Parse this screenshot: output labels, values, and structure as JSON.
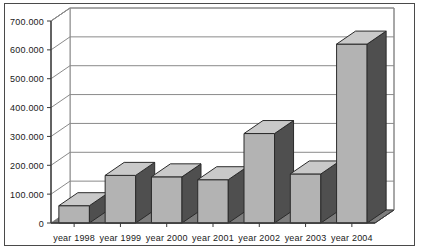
{
  "chart_data": {
    "type": "bar",
    "title": "",
    "subtitle": "",
    "xlabel": "",
    "ylabel": "",
    "categories": [
      "year 1998",
      "year 1999",
      "year 2000",
      "year 2001",
      "year 2002",
      "year 2003",
      "year 2004"
    ],
    "values": [
      60000,
      165000,
      160000,
      150000,
      310000,
      170000,
      620000
    ],
    "ylim": [
      0,
      700000
    ],
    "ytick_values": [
      0,
      100000,
      200000,
      300000,
      400000,
      500000,
      600000,
      700000
    ],
    "ytick_labels": [
      "0",
      "100.000",
      "200.000",
      "300.000",
      "400.000",
      "500.000",
      "600.000",
      "700.000"
    ],
    "grid": true,
    "legend": false,
    "legend_position": "none",
    "three_d": true,
    "series": [
      {
        "name": "",
        "values": [
          60000,
          165000,
          160000,
          150000,
          310000,
          170000,
          620000
        ]
      }
    ],
    "colors": {
      "bar_face": "#b3b3b3",
      "bar_side": "#4f4f4f",
      "bar_top": "#c9c9c9",
      "bar_outline": "#2b2b2b",
      "floor": "#7d7d7d",
      "floor_side": "#5e5e5e",
      "gridline": "#8a8a8a",
      "axis": "#3a3a3a",
      "frame": "#4a4a4a",
      "plot_background": "#ffffff",
      "text": "#1a1a1a"
    }
  }
}
